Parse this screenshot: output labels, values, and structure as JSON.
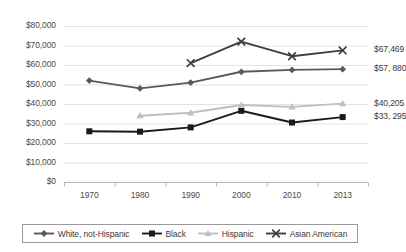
{
  "chart_data": {
    "type": "line",
    "title": "",
    "xlabel": "",
    "ylabel": "",
    "categories": [
      "1970",
      "1980",
      "1990",
      "2000",
      "2010",
      "2013"
    ],
    "ylim": [
      0,
      80000
    ],
    "ytick_step": 10000,
    "ytick_labels": [
      "$80,000",
      "$70,000",
      "$60,000",
      "$50,000",
      "$40,000",
      "$30,000",
      "$20,000",
      "$10,000",
      "$0"
    ],
    "ytick_values": [
      80000,
      70000,
      60000,
      50000,
      40000,
      30000,
      20000,
      10000,
      0
    ],
    "grid": true,
    "legend_position": "bottom",
    "series": [
      {
        "name": "White, not-Hispanic",
        "color": "#595959",
        "marker": "diamond",
        "values": [
          52000,
          48000,
          51000,
          56500,
          57500,
          57880
        ],
        "end_label": "$57, 880"
      },
      {
        "name": "Black",
        "color": "#1a1a1a",
        "marker": "square",
        "values": [
          26000,
          25800,
          28000,
          36500,
          30500,
          33295
        ],
        "end_label": "$33, 295"
      },
      {
        "name": "Hispanic",
        "color": "#bfbfbf",
        "marker": "triangle",
        "values": [
          null,
          34000,
          35500,
          39500,
          38500,
          40205
        ],
        "end_label": "$40,205"
      },
      {
        "name": "Asian American",
        "color": "#3f3f3f",
        "marker": "x",
        "values": [
          null,
          null,
          61000,
          72000,
          64500,
          67469
        ],
        "end_label": "$67,469"
      }
    ]
  }
}
